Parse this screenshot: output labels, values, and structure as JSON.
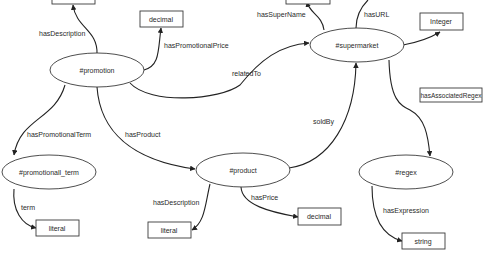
{
  "diagram": {
    "type": "ontology-graph",
    "nodes": {
      "promotion": {
        "label": "#promotion"
      },
      "supermarket": {
        "label": "#supermarket"
      },
      "promotional_term": {
        "label": "#promotionall_term"
      },
      "product": {
        "label": "#product"
      },
      "regex": {
        "label": "#regex"
      }
    },
    "literals": {
      "promotion_description": {
        "label": ""
      },
      "promotion_price": {
        "label": "decimal"
      },
      "supermarket_name": {
        "label": ""
      },
      "supermarket_integer": {
        "label": "Integer"
      },
      "term_literal": {
        "label": "literal"
      },
      "product_description": {
        "label": "literal"
      },
      "product_price": {
        "label": "decimal"
      },
      "regex_expression": {
        "label": "string"
      }
    },
    "edges": {
      "hasDescription_promo": {
        "label": "hasDescription"
      },
      "hasPromotionalPrice": {
        "label": "hasPromotionalPrice"
      },
      "relatedTo": {
        "label": "relatedTo"
      },
      "hasPromotionalTerm": {
        "label": "hasPromotionalTerm"
      },
      "hasProduct": {
        "label": "hasProduct"
      },
      "term": {
        "label": "term"
      },
      "hasSuperName": {
        "label": "hasSuperName"
      },
      "hasURL": {
        "label": "hasURL"
      },
      "hasAssociatedRegex": {
        "label": "hasAssociatedRegex"
      },
      "soldBy": {
        "label": "soldBy"
      },
      "hasDescription_product": {
        "label": "hasDescription"
      },
      "hasPrice": {
        "label": "hasPrice"
      },
      "hasExpression": {
        "label": "hasExpression"
      }
    },
    "colors": {
      "stroke": "#222222",
      "text": "#2a2a2a",
      "background": "#ffffff"
    }
  }
}
